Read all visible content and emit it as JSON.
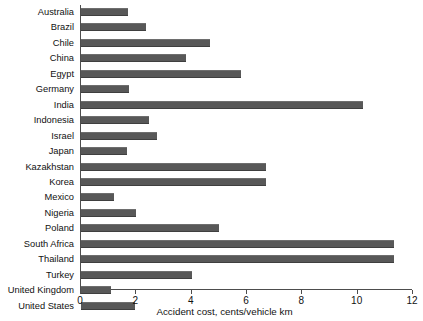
{
  "chart_data": {
    "type": "bar",
    "orientation": "horizontal",
    "title": "",
    "xlabel": "Accident cost, cents/vehicle km",
    "ylabel": "",
    "xlim": [
      0,
      12
    ],
    "xticks": [
      0,
      2,
      4,
      6,
      8,
      10,
      12
    ],
    "grid": false,
    "legend": null,
    "bar_color": "#585858",
    "axis_color": "#4d4d4d",
    "categories": [
      "Australia",
      "Brazil",
      "Chile",
      "China",
      "Egypt",
      "Germany",
      "India",
      "Indonesia",
      "Israel",
      "Japan",
      "Kazakhstan",
      "Korea",
      "Mexico",
      "Nigeria",
      "Poland",
      "South Africa",
      "Thailand",
      "Turkey",
      "United Kingdom",
      "United States"
    ],
    "values": [
      1.7,
      2.35,
      4.65,
      3.8,
      5.8,
      1.75,
      10.2,
      2.45,
      2.75,
      1.65,
      6.7,
      6.7,
      1.2,
      2.0,
      5.0,
      11.3,
      11.3,
      4.0,
      1.1,
      1.95
    ]
  }
}
